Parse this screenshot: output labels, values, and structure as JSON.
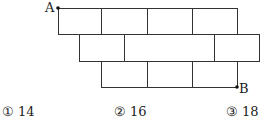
{
  "diagram": {
    "stroke_color": "#333333",
    "point_a": {
      "label": "A",
      "x": 58,
      "y": 8
    },
    "point_b": {
      "label": "B",
      "x": 237,
      "y": 87
    },
    "rows": [
      {
        "y0": 8,
        "y1": 34,
        "x0": 58,
        "x1": 237,
        "dividers": [
          101,
          147,
          192
        ]
      },
      {
        "y0": 34,
        "y1": 61,
        "x0": 79,
        "x1": 259,
        "dividers": [
          124,
          214
        ]
      },
      {
        "y0": 61,
        "y1": 87,
        "x0": 101,
        "x1": 237,
        "dividers": [
          147,
          192
        ]
      }
    ]
  },
  "choices": [
    {
      "marker": "①",
      "value": "14"
    },
    {
      "marker": "②",
      "value": "16"
    },
    {
      "marker": "③",
      "value": "18"
    }
  ]
}
